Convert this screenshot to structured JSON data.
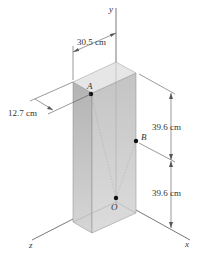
{
  "figure": {
    "axes": {
      "x": "x",
      "y": "y",
      "z": "z"
    },
    "points": {
      "A": "A",
      "B": "B",
      "O": "O"
    },
    "dimensions": {
      "width_top": "30.5 cm",
      "depth_left": "12.7 cm",
      "height_upper": "39.6 cm",
      "height_lower": "39.6 cm"
    },
    "colors": {
      "top_face": "#e4e4e4",
      "left_face": "#b9b9b9",
      "right_face": "#cdcdcd",
      "line": "#555555",
      "point": "#111111"
    }
  }
}
